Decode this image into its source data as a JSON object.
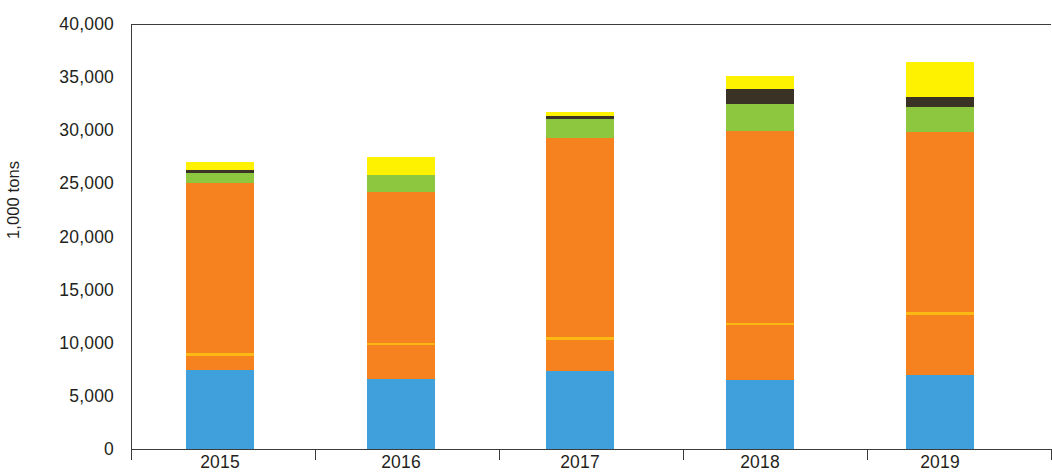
{
  "chart_data": {
    "type": "bar",
    "stacked": true,
    "title": "",
    "subtitle": "",
    "xlabel": "",
    "ylabel": "1,000 tons",
    "ylim": [
      0,
      40000
    ],
    "ytick_values": [
      0,
      5000,
      10000,
      15000,
      20000,
      25000,
      30000,
      35000,
      40000
    ],
    "ytick_labels": [
      "0",
      "5,000",
      "10,000",
      "15,000",
      "20,000",
      "25,000",
      "30,000",
      "35,000",
      "40,000"
    ],
    "grid": false,
    "legend": "none",
    "categories": [
      "2015",
      "2016",
      "2017",
      "2018",
      "2019"
    ],
    "series": [
      {
        "name": "blue-segment",
        "color": "#3FA0DC",
        "values": [
          7450,
          6550,
          7350,
          6500,
          6950
        ]
      },
      {
        "name": "orange-lower-segment",
        "color": "#F5821F",
        "values": [
          1350,
          3250,
          2950,
          5150,
          5700
        ]
      },
      {
        "name": "gold-divider-line",
        "color": "#FDB913",
        "values": [
          200,
          200,
          200,
          200,
          200
        ]
      },
      {
        "name": "orange-upper-segment",
        "color": "#F5821F",
        "values": [
          16000,
          14200,
          18750,
          18100,
          16950
        ]
      },
      {
        "name": "green-segment",
        "color": "#8DC63F",
        "values": [
          950,
          1600,
          1800,
          2550,
          2350
        ]
      },
      {
        "name": "dark-segment",
        "color": "#3B3226",
        "values": [
          300,
          0,
          250,
          1400,
          950
        ]
      },
      {
        "name": "yellow-segment",
        "color": "#FFF200",
        "values": [
          800,
          1650,
          400,
          1200,
          3350
        ]
      }
    ],
    "totals": [
      27050,
      27450,
      31700,
      35100,
      36450
    ],
    "bar_x_centers_px": [
      220,
      401,
      580,
      760,
      940
    ],
    "bar_width_px": 68,
    "colors": {
      "blue": "#3FA0DC",
      "orange": "#F5821F",
      "gold": "#FDB913",
      "green": "#8DC63F",
      "dark": "#3B3226",
      "yellow": "#FFF200",
      "axis": "#3b3b3b",
      "text": "#231f20"
    }
  }
}
